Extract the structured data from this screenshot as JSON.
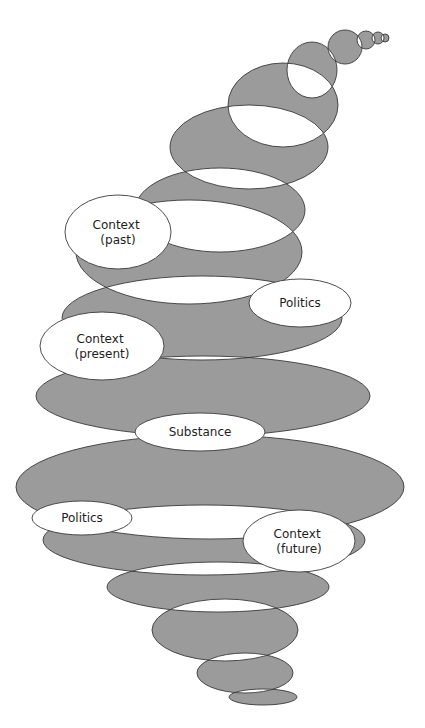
{
  "diagram": {
    "colors": {
      "fill": "#9b9b9b",
      "outline": "#3a3a3a",
      "label_fill": "#ffffff",
      "text": "#1e1e1e",
      "background": "#ffffff"
    },
    "spiral_ellipses": [
      {
        "cx": 385,
        "cy": 38,
        "rx": 4,
        "ry": 4
      },
      {
        "cx": 378,
        "cy": 38,
        "rx": 6,
        "ry": 6
      },
      {
        "cx": 366,
        "cy": 40,
        "rx": 9,
        "ry": 9
      },
      {
        "cx": 345,
        "cy": 47,
        "rx": 17,
        "ry": 17
      },
      {
        "cx": 312,
        "cy": 70,
        "rx": 25,
        "ry": 28
      },
      {
        "cx": 283,
        "cy": 105,
        "rx": 55,
        "ry": 42
      },
      {
        "cx": 249,
        "cy": 147,
        "rx": 79,
        "ry": 42
      },
      {
        "cx": 220,
        "cy": 210,
        "rx": 85,
        "ry": 42
      },
      {
        "cx": 189,
        "cy": 252,
        "rx": 113,
        "ry": 52
      },
      {
        "cx": 202,
        "cy": 318,
        "rx": 140,
        "ry": 42
      },
      {
        "cx": 203,
        "cy": 396,
        "rx": 167,
        "ry": 40
      },
      {
        "cx": 210,
        "cy": 487,
        "rx": 194,
        "ry": 52
      },
      {
        "cx": 204,
        "cy": 540,
        "rx": 161,
        "ry": 35
      },
      {
        "cx": 218,
        "cy": 587,
        "rx": 111,
        "ry": 25
      },
      {
        "cx": 225,
        "cy": 630,
        "rx": 73,
        "ry": 31
      },
      {
        "cx": 245,
        "cy": 673,
        "rx": 48,
        "ry": 20
      },
      {
        "cx": 263,
        "cy": 697,
        "rx": 34,
        "ry": 8
      }
    ],
    "labels": [
      {
        "id": "context-past",
        "lines": [
          "Context",
          "(past)"
        ],
        "cx": 118,
        "cy": 232,
        "rx": 53,
        "ry": 37
      },
      {
        "id": "politics-top",
        "lines": [
          "Politics"
        ],
        "cx": 300,
        "cy": 303,
        "rx": 51,
        "ry": 24
      },
      {
        "id": "context-present",
        "lines": [
          "Context",
          "(present)"
        ],
        "cx": 102,
        "cy": 346,
        "rx": 62,
        "ry": 34
      },
      {
        "id": "substance",
        "lines": [
          "Substance"
        ],
        "cx": 200,
        "cy": 432,
        "rx": 65,
        "ry": 19
      },
      {
        "id": "politics-bottom",
        "lines": [
          "Politics"
        ],
        "cx": 82,
        "cy": 518,
        "rx": 50,
        "ry": 17
      },
      {
        "id": "context-future",
        "lines": [
          "Context",
          "(future)"
        ],
        "cx": 299,
        "cy": 541,
        "rx": 56,
        "ry": 31
      }
    ]
  }
}
